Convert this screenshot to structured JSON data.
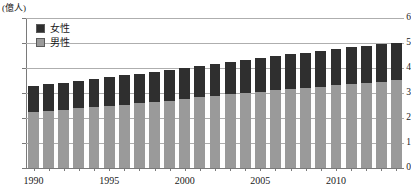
{
  "chart": {
    "title": "",
    "unit_label": "(億人)",
    "legend": {
      "female_label": "女性",
      "male_label": "男性"
    },
    "colors": {
      "female": "#2f2f2f",
      "male": "#9a9a9a",
      "gridline": "#aeaeae",
      "axis": "#7a7a7a",
      "background": "#ffffff"
    },
    "y_ticks": [
      "0",
      "1",
      "2",
      "3",
      "4",
      "5",
      "6"
    ],
    "x_ticks": [
      "1990",
      "1995",
      "2000",
      "2005",
      "2010"
    ]
  },
  "chart_data": {
    "type": "bar",
    "title": "",
    "subtitle": "",
    "xlabel": "",
    "ylabel": "(億人)",
    "ylim": [
      0,
      6
    ],
    "grid": true,
    "stacked": true,
    "legend_position": "upper-left",
    "categories": [
      "1990",
      "1991",
      "1992",
      "1993",
      "1994",
      "1995",
      "1996",
      "1997",
      "1998",
      "1999",
      "2000",
      "2001",
      "2002",
      "2003",
      "2004",
      "2005",
      "2006",
      "2007",
      "2008",
      "2009",
      "2010",
      "2011",
      "2012",
      "2013",
      "2014"
    ],
    "series": [
      {
        "name": "男性",
        "values": [
          2.25,
          2.3,
          2.34,
          2.39,
          2.44,
          2.49,
          2.54,
          2.59,
          2.64,
          2.7,
          2.77,
          2.83,
          2.89,
          2.95,
          3.0,
          3.06,
          3.11,
          3.16,
          3.21,
          3.26,
          3.31,
          3.36,
          3.41,
          3.46,
          3.52
        ]
      },
      {
        "name": "女性",
        "values": [
          1.05,
          1.06,
          1.08,
          1.11,
          1.13,
          1.15,
          1.17,
          1.19,
          1.21,
          1.23,
          1.25,
          1.27,
          1.29,
          1.31,
          1.33,
          1.35,
          1.37,
          1.39,
          1.41,
          1.43,
          1.45,
          1.47,
          1.49,
          1.51,
          1.5
        ]
      }
    ],
    "totals": [
      3.3,
      3.36,
      3.42,
      3.5,
      3.57,
      3.64,
      3.71,
      3.78,
      3.85,
      3.93,
      4.02,
      4.1,
      4.18,
      4.26,
      4.33,
      4.41,
      4.48,
      4.55,
      4.62,
      4.69,
      4.76,
      4.83,
      4.9,
      4.97,
      5.02
    ],
    "y_tick_values": [
      0,
      1,
      2,
      3,
      4,
      5,
      6
    ],
    "x_tick_values": [
      1990,
      1995,
      2000,
      2005,
      2010
    ]
  }
}
